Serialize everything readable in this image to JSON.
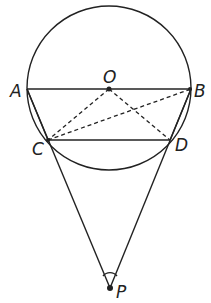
{
  "diagram": {
    "type": "geometry",
    "circle": {
      "center": "O",
      "cx": 109,
      "cy": 88,
      "r": 82
    },
    "points": {
      "A": {
        "label": "A",
        "x": 27,
        "y": 89
      },
      "B": {
        "label": "B",
        "x": 191,
        "y": 89
      },
      "O": {
        "label": "O",
        "x": 109,
        "y": 89
      },
      "C": {
        "label": "C",
        "x": 48,
        "y": 140
      },
      "D": {
        "label": "D",
        "x": 170,
        "y": 140
      },
      "P": {
        "label": "P",
        "x": 110,
        "y": 288
      }
    },
    "solid_segments": [
      "AB",
      "CD",
      "AC",
      "BD",
      "PC",
      "PD"
    ],
    "dashed_segments": [
      "OC",
      "OD",
      "CB"
    ],
    "angle_mark": "P"
  },
  "labels": {
    "A": "A",
    "B": "B",
    "C": "C",
    "D": "D",
    "O": "O",
    "P": "P"
  }
}
